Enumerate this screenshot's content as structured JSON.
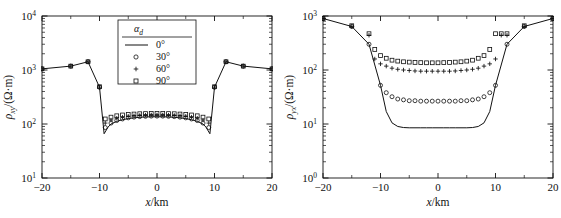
{
  "figure": {
    "panel_count": 2,
    "background": "#ffffff",
    "line_color": "#000000",
    "marker_color": "#000000"
  },
  "legend": {
    "title_symbol": "α",
    "title_subscript": "d",
    "entries": [
      {
        "label": "0°",
        "marker": "line"
      },
      {
        "label": "30°",
        "marker": "open-circle"
      },
      {
        "label": "60°",
        "marker": "plus"
      },
      {
        "label": "90°",
        "marker": "open-square"
      }
    ]
  },
  "chart_data": [
    {
      "type": "line",
      "panel": "left",
      "title": "",
      "xlabel": "x/km",
      "ylabel": "ρxy/(Ω·m)",
      "ylabel_symbol": "ρ",
      "ylabel_subscript": "xy",
      "ylabel_units": "/(Ω·m)",
      "xlim": [
        -20,
        20
      ],
      "ylim": [
        10,
        10000
      ],
      "yscale": "log",
      "xticks": [
        -20,
        -10,
        0,
        10,
        20
      ],
      "xticklabels": [
        "-20",
        "-10",
        "0",
        "10",
        "20"
      ],
      "yticks": [
        10,
        100,
        1000,
        10000
      ],
      "yticklabels": [
        "10¹",
        "10²",
        "10³",
        "10⁴"
      ],
      "grid": false,
      "legend_position": "upper-center",
      "series": [
        {
          "name": "0°",
          "marker": "line",
          "x": [
            -20,
            -15,
            -12,
            -10,
            -9.2,
            -8.5,
            -8,
            -7,
            -6,
            -5,
            -4,
            -3,
            -2,
            -1,
            0,
            1,
            2,
            3,
            4,
            5,
            6,
            7,
            8,
            8.5,
            9.2,
            10,
            12,
            15,
            20
          ],
          "values": [
            1050,
            1180,
            1420,
            480,
            66,
            88,
            100,
            112,
            120,
            126,
            130,
            133,
            135,
            136,
            136,
            136,
            135,
            133,
            130,
            126,
            120,
            112,
            100,
            88,
            66,
            480,
            1420,
            1180,
            1050
          ]
        },
        {
          "name": "30°",
          "marker": "open-circle",
          "x": [
            -20,
            -15,
            -12,
            -10,
            -9,
            -8,
            -7,
            -6,
            -5,
            -4,
            -3,
            -2,
            -1,
            0,
            1,
            2,
            3,
            4,
            5,
            6,
            7,
            8,
            9,
            10,
            12,
            15,
            20
          ],
          "values": [
            1050,
            1180,
            1420,
            480,
            86,
            104,
            116,
            124,
            130,
            134,
            137,
            139,
            140,
            140,
            140,
            139,
            137,
            134,
            130,
            124,
            116,
            104,
            86,
            480,
            1420,
            1180,
            1050
          ]
        },
        {
          "name": "60°",
          "marker": "plus",
          "x": [
            -20,
            -15,
            -12,
            -10,
            -9,
            -8,
            -7,
            -6,
            -5,
            -4,
            -3,
            -2,
            -1,
            0,
            1,
            2,
            3,
            4,
            5,
            6,
            7,
            8,
            9,
            10,
            12,
            15,
            20
          ],
          "values": [
            1050,
            1180,
            1420,
            480,
            104,
            118,
            128,
            134,
            139,
            142,
            144,
            146,
            147,
            147,
            147,
            146,
            144,
            142,
            139,
            134,
            128,
            118,
            104,
            480,
            1420,
            1180,
            1050
          ]
        },
        {
          "name": "90°",
          "marker": "open-square",
          "x": [
            -20,
            -15,
            -12,
            -10,
            -9,
            -8,
            -7,
            -6,
            -5,
            -4,
            -3,
            -2,
            -1,
            0,
            1,
            2,
            3,
            4,
            5,
            6,
            7,
            8,
            9,
            10,
            12,
            15,
            20
          ],
          "values": [
            1050,
            1180,
            1420,
            490,
            124,
            134,
            142,
            147,
            150,
            153,
            155,
            156,
            157,
            157,
            157,
            156,
            155,
            153,
            150,
            147,
            142,
            134,
            124,
            490,
            1420,
            1180,
            1050
          ]
        }
      ]
    },
    {
      "type": "line",
      "panel": "right",
      "title": "",
      "xlabel": "x/km",
      "ylabel": "ρyx/(Ω·m)",
      "ylabel_symbol": "ρ",
      "ylabel_subscript": "yx",
      "ylabel_units": "/(Ω·m)",
      "xlim": [
        -20,
        20
      ],
      "ylim": [
        1,
        1000
      ],
      "yscale": "log",
      "xticks": [
        -20,
        -10,
        0,
        10,
        20
      ],
      "xticklabels": [
        "-20",
        "-10",
        "0",
        "10",
        "20"
      ],
      "yticks": [
        1,
        10,
        100,
        1000
      ],
      "yticklabels": [
        "10⁰",
        "10¹",
        "10²",
        "10³"
      ],
      "grid": false,
      "legend_position": "none",
      "series": [
        {
          "name": "0°",
          "marker": "line",
          "x": [
            -20,
            -15,
            -12,
            -10,
            -9,
            -8,
            -7,
            -6,
            -5,
            -4,
            -3,
            -2,
            -1,
            0,
            1,
            2,
            3,
            4,
            5,
            6,
            7,
            8,
            9,
            10,
            12,
            15,
            20
          ],
          "values": [
            900,
            640,
            300,
            52,
            17,
            10.5,
            9.0,
            8.6,
            8.5,
            8.5,
            8.5,
            8.5,
            8.5,
            8.5,
            8.5,
            8.5,
            8.5,
            8.5,
            8.5,
            8.6,
            9.0,
            10.5,
            17,
            52,
            300,
            640,
            900
          ]
        },
        {
          "name": "30°",
          "marker": "open-circle",
          "x": [
            -20,
            -15,
            -12,
            -10,
            -9,
            -8,
            -7,
            -6,
            -5,
            -4,
            -3,
            -2,
            -1,
            0,
            1,
            2,
            3,
            4,
            5,
            6,
            7,
            8,
            9,
            10,
            12,
            15,
            20
          ],
          "values": [
            900,
            640,
            300,
            52,
            38,
            32,
            29,
            28,
            27,
            27,
            26.5,
            26.5,
            26.5,
            26.5,
            26.5,
            26.5,
            26.5,
            27,
            27,
            28,
            29,
            32,
            38,
            52,
            300,
            640,
            900
          ]
        },
        {
          "name": "60°",
          "marker": "plus",
          "x": [
            -20,
            -15,
            -12,
            -11,
            -10,
            -9,
            -8,
            -7,
            -6,
            -5,
            -4,
            -3,
            -2,
            -1,
            0,
            1,
            2,
            3,
            4,
            5,
            6,
            7,
            8,
            9,
            10,
            11,
            12,
            15,
            20
          ],
          "values": [
            900,
            640,
            440,
            160,
            130,
            118,
            108,
            103,
            100,
            98,
            96,
            95,
            95,
            95,
            95,
            95,
            95,
            96,
            98,
            100,
            103,
            108,
            118,
            130,
            160,
            440,
            440,
            640,
            900
          ]
        },
        {
          "name": "90°",
          "marker": "open-square",
          "x": [
            -20,
            -15,
            -12,
            -11,
            -10,
            -9,
            -8,
            -7,
            -6,
            -5,
            -4,
            -3,
            -2,
            -1,
            0,
            1,
            2,
            3,
            4,
            5,
            6,
            7,
            8,
            9,
            10,
            11,
            12,
            15,
            20
          ],
          "values": [
            900,
            660,
            470,
            240,
            185,
            165,
            152,
            146,
            142,
            140,
            138,
            137,
            136,
            136,
            136,
            137,
            138,
            140,
            142,
            146,
            152,
            165,
            185,
            240,
            470,
            470,
            470,
            660,
            900
          ]
        }
      ]
    }
  ]
}
